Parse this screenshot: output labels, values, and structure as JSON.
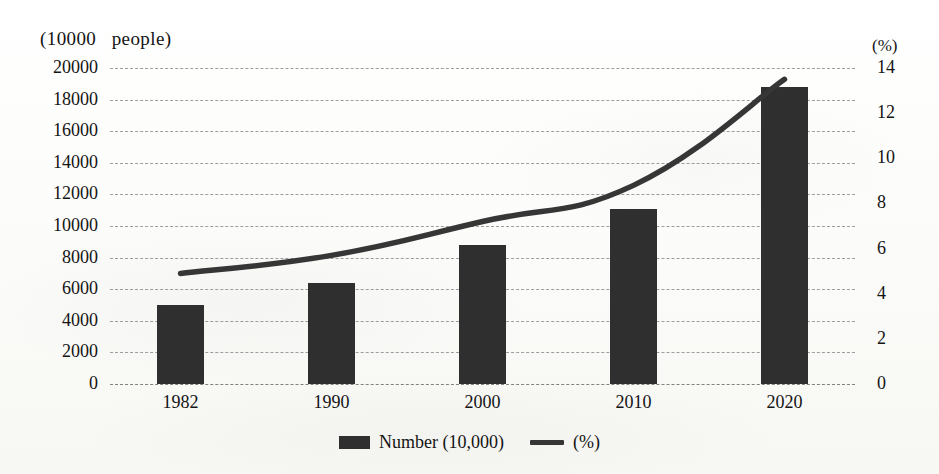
{
  "axes": {
    "left_title": "(10000   people)",
    "right_title": "(%)",
    "left_ticks": [
      "20000",
      "18000",
      "16000",
      "14000",
      "12000",
      "10000",
      "8000",
      "6000",
      "4000",
      "2000",
      "0"
    ],
    "right_ticks": [
      "14",
      "12",
      "10",
      "8",
      "6",
      "4",
      "2",
      "0"
    ]
  },
  "legend": {
    "bar_label": "Number (10,000)",
    "line_label": "(%)"
  },
  "colors": {
    "bar": "#2f2f2f",
    "line": "#363636",
    "grid": "#8e8e8e",
    "text": "#141414",
    "background": "#fbfbf9"
  },
  "chart_data": {
    "type": "bar",
    "title": "",
    "subtitle": "",
    "xlabel": "",
    "ylabel": "(10000   people)",
    "y2label": "(%)",
    "categories": [
      "1982",
      "1990",
      "2000",
      "2010",
      "2020"
    ],
    "ylim": [
      0,
      20000
    ],
    "y2lim": [
      0,
      14
    ],
    "ytick_step": 2000,
    "y2tick_step": 2,
    "grid": true,
    "legend_position": "bottom-center",
    "series": [
      {
        "name": "Number (10,000)",
        "type": "bar",
        "axis": "left",
        "values": [
          5000,
          6400,
          8800,
          11100,
          18800
        ]
      },
      {
        "name": "(%)",
        "type": "line",
        "axis": "right",
        "values": [
          4.9,
          5.7,
          7.2,
          8.8,
          13.5
        ]
      }
    ]
  }
}
